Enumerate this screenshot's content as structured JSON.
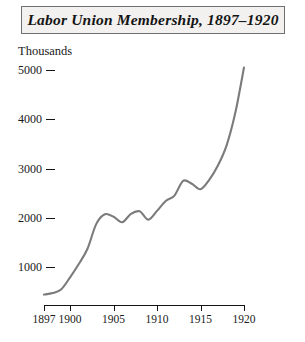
{
  "title": {
    "text": "Labor Union Membership, 1897–1920"
  },
  "axis": {
    "unit_label": "Thousands",
    "y_ticks": [
      1000,
      2000,
      3000,
      4000,
      5000
    ],
    "x_ticks": [
      1897,
      1900,
      1905,
      1910,
      1915,
      1920
    ]
  },
  "colors": {
    "line": "#7b7b7b",
    "axis": "#141414",
    "text": "#1a1a1a",
    "title_box_fill": "#f2f1ef",
    "title_box_border": "#6f6f6f",
    "background": "#ffffff"
  },
  "chart_data": {
    "type": "line",
    "title": "Labor Union Membership, 1897–1920",
    "xlabel": "",
    "ylabel": "Thousands",
    "xlim": [
      1897,
      1920
    ],
    "ylim": [
      0,
      5100
    ],
    "grid": false,
    "legend": "none",
    "x": [
      1897,
      1898,
      1899,
      1900,
      1901,
      1902,
      1903,
      1904,
      1905,
      1906,
      1907,
      1908,
      1909,
      1910,
      1911,
      1912,
      1913,
      1914,
      1915,
      1916,
      1917,
      1918,
      1919,
      1920
    ],
    "series": [
      {
        "name": "Labor union membership",
        "values": [
          440,
          470,
          550,
          790,
          1060,
          1370,
          1870,
          2070,
          2020,
          1910,
          2080,
          2130,
          1960,
          2140,
          2340,
          2450,
          2750,
          2690,
          2580,
          2770,
          3060,
          3470,
          4130,
          5050
        ]
      }
    ]
  }
}
